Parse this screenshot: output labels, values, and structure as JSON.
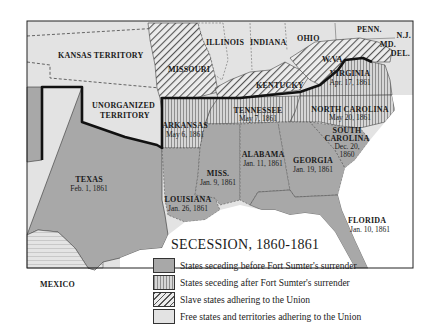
{
  "map": {
    "title": "SECESSION, 1860-1861",
    "colors": {
      "before_sumter": "#a8a8a8",
      "after_sumter": "#d2d2d2",
      "after_sumter_stripe": "#8e8e8e",
      "slave_union": "#e6e6e6",
      "slave_union_hatch": "#555555",
      "free_union": "#e3e3e3",
      "water": "#ffffff",
      "border": "#111111"
    },
    "regions": {
      "kansas": {
        "name": "KANSAS TERRITORY"
      },
      "unorganized": {
        "name": "UNORGANIZED",
        "name2": "TERRITORY"
      },
      "missouri": {
        "name": "MISSOURI"
      },
      "illinois": {
        "name": "ILLINOIS"
      },
      "indiana": {
        "name": "INDIANA"
      },
      "ohio": {
        "name": "OHIO"
      },
      "penn": {
        "name": "PENN."
      },
      "nj": {
        "name": "N.J."
      },
      "md": {
        "name": "MD."
      },
      "del": {
        "name": "DEL."
      },
      "wva": {
        "name": "W.VA."
      },
      "kentucky": {
        "name": "KENTUCKY"
      },
      "virginia": {
        "name": "VIRGINIA",
        "date": "Apr. 17, 1861"
      },
      "tennessee": {
        "name": "TENNESSEE",
        "date": "May 7, 1861"
      },
      "north_carolina": {
        "name": "NORTH CAROLINA",
        "date": "May 20, 1861"
      },
      "arkansas": {
        "name": "ARKANSAS",
        "date": "May 6, 1861"
      },
      "south_carolina": {
        "name": "SOUTH",
        "name2": "CAROLINA",
        "date": "Dec. 20,",
        "date2": "1860"
      },
      "texas": {
        "name": "TEXAS",
        "date": "Feb. 1, 1861"
      },
      "mississippi": {
        "name": "MISS.",
        "date": "Jan. 9, 1861"
      },
      "alabama": {
        "name": "ALABAMA",
        "date": "Jan. 11, 1861"
      },
      "georgia": {
        "name": "GEORGIA",
        "date": "Jan. 19, 1861"
      },
      "louisiana": {
        "name": "LOUISIANA",
        "date": "Jan. 26, 1861"
      },
      "florida": {
        "name": "FLORIDA",
        "date": "Jan. 10, 1861"
      },
      "mexico": {
        "name": "MEXICO"
      }
    },
    "legend": [
      {
        "key": "before",
        "label": "States seceding before Fort Sumter's surrender"
      },
      {
        "key": "after",
        "label": "States seceding after Fort Sumter's surrender"
      },
      {
        "key": "slave",
        "label": "Slave states adhering to the Union"
      },
      {
        "key": "free",
        "label": "Free states and territories adhering to the Union"
      }
    ]
  }
}
